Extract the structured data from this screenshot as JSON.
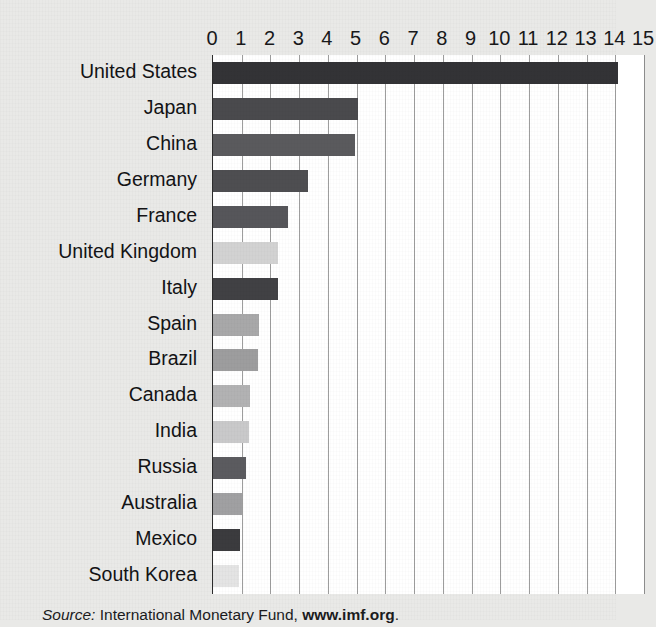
{
  "chart_data": {
    "type": "bar",
    "orientation": "horizontal",
    "title": "",
    "xlabel": "",
    "ylabel": "",
    "xlim": [
      0,
      15
    ],
    "grid": true,
    "legend": false,
    "axis_ticks": [
      "0",
      "1",
      "2",
      "3",
      "4",
      "5",
      "6",
      "7",
      "8",
      "9",
      "10",
      "11",
      "12",
      "13",
      "14",
      "15"
    ],
    "categories": [
      "United States",
      "Japan",
      "China",
      "Germany",
      "France",
      "United Kingdom",
      "Italy",
      "Spain",
      "Brazil",
      "Canada",
      "India",
      "Russia",
      "Australia",
      "Mexico",
      "South Korea"
    ],
    "values": [
      14.1,
      5.05,
      4.95,
      3.3,
      2.6,
      2.25,
      2.25,
      1.6,
      1.55,
      1.3,
      1.25,
      1.15,
      1.0,
      0.95,
      0.9
    ],
    "bar_colors": [
      "#333336",
      "#4a4a4d",
      "#5a5a5d",
      "#4e4e51",
      "#56565a",
      "#d2d2d2",
      "#414144",
      "#a8a8a9",
      "#9d9d9e",
      "#b2b2b3",
      "#c9c9ca",
      "#5b5b5f",
      "#a0a0a2",
      "#3b3b3e",
      "#e4e4e4"
    ]
  },
  "source": {
    "label": "Source:",
    "publisher": "International Monetary Fund,",
    "url": "www.imf.org",
    "period": "."
  },
  "colors": {
    "page_background": "#e9e9e7",
    "plot_background": "#ffffff",
    "gridline": "#9d9d9d",
    "axis": "#2b2b2b",
    "text": "#18181a"
  }
}
